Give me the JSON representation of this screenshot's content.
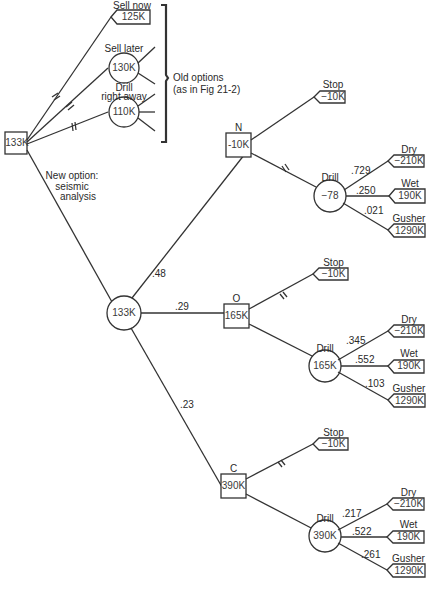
{
  "root": {
    "value": "133K"
  },
  "old_options": {
    "bracket_label_line1": "Old options",
    "bracket_label_line2": "(as in Fig 21-2)",
    "sell_now": {
      "label": "Sell now",
      "value": "125K"
    },
    "sell_later": {
      "label": "Sell later",
      "value": "130K"
    },
    "drill_right_away": {
      "label_line1": "Drill",
      "label_line2": "right away",
      "value": "110K"
    }
  },
  "new_option": {
    "label_line1": "New option:",
    "label_line2": "seismic",
    "label_line3": "analysis",
    "value": "133K"
  },
  "branches": [
    {
      "result": "N",
      "probability": ".48",
      "decision_value": "-10K",
      "stop": {
        "label": "Stop",
        "value": "−10K"
      },
      "drill": {
        "label": "Drill",
        "value": "−78",
        "outcomes": [
          {
            "label": "Dry",
            "probability": ".729",
            "value": "−210K"
          },
          {
            "label": "Wet",
            "probability": ".250",
            "value": "190K"
          },
          {
            "label": "Gusher",
            "probability": ".021",
            "value": "1290K"
          }
        ]
      }
    },
    {
      "result": "O",
      "probability": ".29",
      "decision_value": "165K",
      "stop": {
        "label": "Stop",
        "value": "−10K"
      },
      "drill": {
        "label": "Drill",
        "value": "165K",
        "outcomes": [
          {
            "label": "Dry",
            "probability": ".345",
            "value": "−210K"
          },
          {
            "label": "Wet",
            "probability": ".552",
            "value": "190K"
          },
          {
            "label": "Gusher",
            "probability": ".103",
            "value": "1290K"
          }
        ]
      }
    },
    {
      "result": "C",
      "probability": ".23",
      "decision_value": "390K",
      "stop": {
        "label": "Stop",
        "value": "−10K"
      },
      "drill": {
        "label": "Drill",
        "value": "390K",
        "outcomes": [
          {
            "label": "Dry",
            "probability": ".217",
            "value": "−210K"
          },
          {
            "label": "Wet",
            "probability": ".522",
            "value": "190K"
          },
          {
            "label": "Gusher",
            "probability": ".261",
            "value": "1290K"
          }
        ]
      }
    }
  ]
}
